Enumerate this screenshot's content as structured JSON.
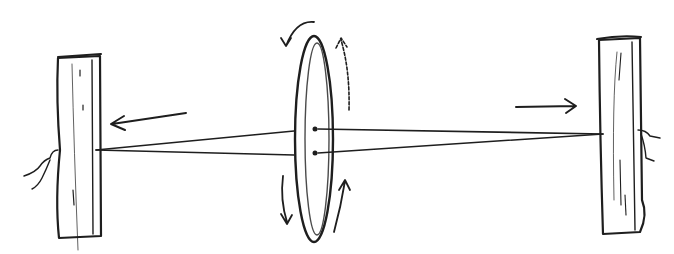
{
  "diagram": {
    "colors": {
      "ink": "#1e1e1e",
      "wood_light": "#b8b8b8",
      "wood_dark": "#8a8a8a",
      "disc_fill": "#c4c4c4",
      "disc_dark": "#8e8e8e",
      "background": "#ffffff"
    },
    "elements": [
      {
        "id": "left-post",
        "shape": "vertical wooden plank",
        "x": 57,
        "y": 55,
        "w": 45,
        "h": 185
      },
      {
        "id": "right-post",
        "shape": "vertical wooden plank",
        "x": 598,
        "y": 35,
        "w": 45,
        "h": 198
      },
      {
        "id": "disc",
        "shape": "thin ellipse seen edge-on",
        "cx": 314,
        "cy": 138,
        "rx": 17,
        "ry": 100
      },
      {
        "id": "string-top",
        "from": "left-post",
        "to": "right-post",
        "via": "disc upper hole"
      },
      {
        "id": "string-bottom",
        "from": "left-post",
        "to": "right-post",
        "via": "disc lower hole"
      },
      {
        "id": "arrow-left",
        "direction": "left",
        "meaning": "pull left post outward"
      },
      {
        "id": "arrow-right",
        "direction": "right",
        "meaning": "pull right post outward"
      },
      {
        "id": "rotation-arrows",
        "count": 4,
        "meaning": "disc spinning"
      }
    ]
  }
}
